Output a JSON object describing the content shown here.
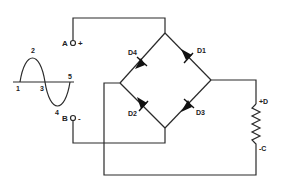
{
  "diagram": {
    "type": "full-wave bridge rectifier",
    "waveform": {
      "labels": [
        "1",
        "2",
        "3",
        "4",
        "5"
      ]
    },
    "terminals": {
      "a": {
        "label": "A",
        "polarity": "+"
      },
      "b": {
        "label": "B",
        "polarity": "-"
      }
    },
    "diodes": [
      {
        "id": "D4",
        "label": "D4"
      },
      {
        "id": "D1",
        "label": "D1"
      },
      {
        "id": "D2",
        "label": "D2"
      },
      {
        "id": "D3",
        "label": "D3"
      }
    ],
    "load": {
      "top_label": "+D",
      "bottom_label": "-C"
    }
  }
}
